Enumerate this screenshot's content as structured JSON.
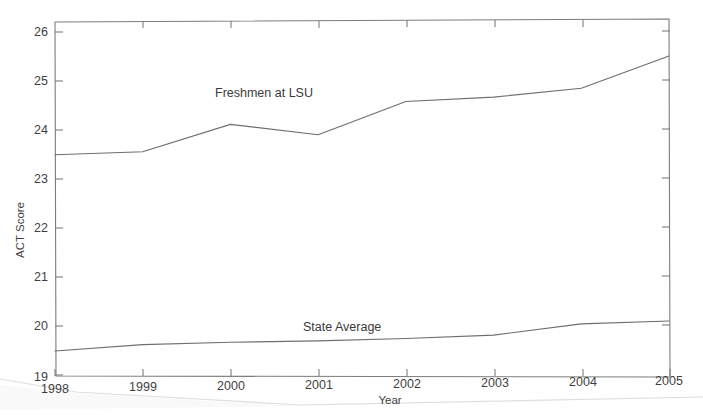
{
  "chart_data": {
    "type": "line",
    "title": "",
    "xlabel": "Year",
    "ylabel": "ACT Score",
    "x": [
      1998,
      1999,
      2000,
      2001,
      2002,
      2003,
      2004,
      2005
    ],
    "xtick_labels": [
      "1998",
      "1999",
      "2000",
      "2001",
      "2002",
      "2003",
      "2004",
      "2005"
    ],
    "ytick_labels": [
      "19",
      "20",
      "21",
      "22",
      "23",
      "24",
      "25",
      "26"
    ],
    "ytick_values": [
      19,
      20,
      21,
      22,
      23,
      24,
      25,
      26
    ],
    "xlim": [
      1998,
      2005
    ],
    "ylim": [
      19,
      26
    ],
    "grid": false,
    "legend_position": "inline-annotations",
    "series": [
      {
        "name": "Freshmen at LSU",
        "values": [
          23.5,
          23.55,
          24.1,
          23.88,
          24.55,
          24.63,
          24.8,
          25.45
        ],
        "color": "#6e6e6e",
        "label_x": 2001.1,
        "label_y": 25.2
      },
      {
        "name": "State Average",
        "values": [
          19.5,
          19.62,
          19.66,
          19.68,
          19.72,
          19.78,
          20.0,
          20.05
        ],
        "color": "#6e6e6e",
        "label_x": 2002.2,
        "label_y": 20.15
      }
    ],
    "annotations": [
      {
        "text": "Freshmen at LSU",
        "x_px": 215,
        "y_px": 97
      },
      {
        "text": "State Average",
        "x_px": 303,
        "y_px": 331
      }
    ]
  },
  "axes": {
    "y_axis_title": "ACT Score",
    "x_axis_title": "Year"
  },
  "colors": {
    "line": "#6e6e6e",
    "axis": "#7d7d7d",
    "text": "#3f3f3f",
    "background": "#ffffff"
  }
}
